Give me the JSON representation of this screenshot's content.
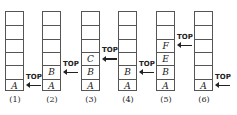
{
  "diagram": {
    "pointer_label": "TOP",
    "stacks": [
      {
        "label": "(1)",
        "cells": [
          "",
          "",
          "",
          "",
          "",
          "A"
        ],
        "top_index": 5
      },
      {
        "label": "(2)",
        "cells": [
          "",
          "",
          "",
          "",
          "B",
          "A"
        ],
        "top_index": 4
      },
      {
        "label": "(3)",
        "cells": [
          "",
          "",
          "",
          "C",
          "B",
          "A"
        ],
        "top_index": 3
      },
      {
        "label": "(4)",
        "cells": [
          "",
          "",
          "",
          "",
          "B",
          "A"
        ],
        "top_index": 4
      },
      {
        "label": "(5)",
        "cells": [
          "",
          "",
          "F",
          "E",
          "B",
          "A"
        ],
        "top_index": 2
      },
      {
        "label": "(6)",
        "cells": [
          "",
          "",
          "",
          "",
          "",
          "A"
        ],
        "top_index": 5
      }
    ]
  }
}
